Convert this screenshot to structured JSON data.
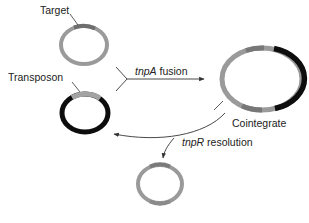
{
  "diagram": {
    "colors": {
      "target_dna": "#9a9a9a",
      "target_site": "#6e6e6e",
      "transposon_dna": "#0d0d0d",
      "transposon_site": "#a3a3a3",
      "line": "#333333",
      "text": "#222222"
    },
    "nodes": [
      {
        "id": "target",
        "label": "Target",
        "kind": "plasmid-ring"
      },
      {
        "id": "transposon",
        "label": "Transposon",
        "kind": "plasmid-ring"
      },
      {
        "id": "cointegrate",
        "label": "Cointegrate",
        "kind": "plasmid-ring"
      },
      {
        "id": "product",
        "label": "",
        "kind": "plasmid-ring"
      }
    ],
    "edges": [
      {
        "from": [
          "target",
          "transposon"
        ],
        "to": "cointegrate",
        "gene": "tnpA",
        "label": "fusion"
      },
      {
        "from": "cointegrate",
        "to": [
          "transposon",
          "product"
        ],
        "gene": "tnpR",
        "label": "resolution"
      }
    ]
  },
  "labels": {
    "target": "Target",
    "transposon": "Transposon",
    "cointegrate": "Cointegrate",
    "fusion_gene": "tnpA",
    "fusion_text": " fusion",
    "resolution_gene": "tnpR",
    "resolution_text": " resolution"
  }
}
